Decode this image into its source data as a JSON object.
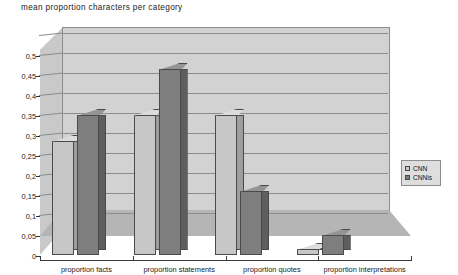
{
  "chart_data": {
    "type": "bar",
    "title": "mean proportion characters per category",
    "xlabel": "",
    "ylabel": "",
    "ylim": [
      0,
      0.5
    ],
    "ytick_labels": [
      "0",
      "0,05",
      "0,1",
      "0,15",
      "0,2",
      "0,25",
      "0,3",
      "0,35",
      "0,4",
      "0,45",
      "0,5"
    ],
    "ytick_values": [
      0,
      0.05,
      0.1,
      0.15,
      0.2,
      0.25,
      0.3,
      0.35,
      0.4,
      0.45,
      0.5
    ],
    "grid": true,
    "legend_position": "right",
    "style": "3d-bar",
    "categories": [
      "proportion facts",
      "proportion statements",
      "proportion quotes",
      "proportion interpretations"
    ],
    "series": [
      {
        "name": "CNN",
        "values": [
          0.285,
          0.35,
          0.35,
          0.015
        ]
      },
      {
        "name": "CNNis",
        "values": [
          0.35,
          0.465,
          0.16,
          0.05
        ]
      }
    ],
    "colors": {
      "series_cnn": "#c7c7c7",
      "series_cnnis": "#7e7e7e",
      "plot_background": "#d2d2d2",
      "floor": "#b5b5b5",
      "gridline": "#8d8d8d",
      "legend_background": "#dedede",
      "page_background": "#ffffff",
      "text": "#1a1a1a"
    }
  }
}
